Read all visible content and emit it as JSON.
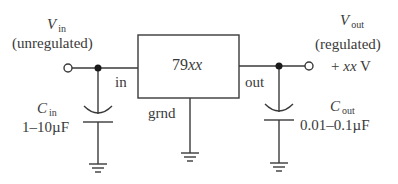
{
  "diagram": {
    "type": "voltage-regulator-circuit",
    "regulator": {
      "label_prefix": "79",
      "label_suffix": "xx",
      "pins": {
        "in": "in",
        "out": "out",
        "ground": "grnd"
      }
    },
    "input": {
      "symbol": "V",
      "subscript": "in",
      "description": "(unregulated)"
    },
    "output": {
      "symbol": "V",
      "subscript": "out",
      "description": "(regulated)",
      "value_prefix": "+ ",
      "value_var": "xx",
      "value_unit": " V"
    },
    "input_capacitor": {
      "symbol": "C",
      "subscript": "in",
      "value": "1–10µF"
    },
    "output_capacitor": {
      "symbol": "C",
      "subscript": "out",
      "value": "0.01–0.1µF"
    },
    "colors": {
      "stroke": "#3a3a3a",
      "background": "#ffffff"
    }
  }
}
